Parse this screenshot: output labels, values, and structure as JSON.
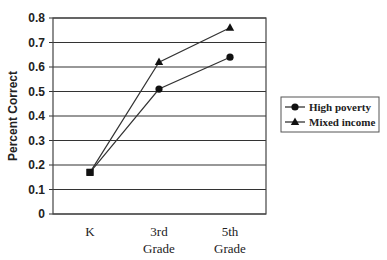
{
  "chart_data": {
    "type": "line",
    "title": "",
    "xlabel": "",
    "ylabel": "Percent Correct",
    "categories": [
      "K",
      "3rd Grade",
      "5th Grade"
    ],
    "category_lines": [
      [
        "K"
      ],
      [
        "3rd",
        "Grade"
      ],
      [
        "5th",
        "Grade"
      ]
    ],
    "series": [
      {
        "name": "High poverty",
        "marker": "circle",
        "values": [
          0.17,
          0.51,
          0.64
        ]
      },
      {
        "name": "Mixed income",
        "marker": "triangle",
        "values": [
          0.17,
          0.62,
          0.76
        ]
      }
    ],
    "ylim": [
      0,
      0.8
    ],
    "yticks": [
      "0",
      "0.1",
      "0.2",
      "0.3",
      "0.4",
      "0.5",
      "0.6",
      "0.7",
      "0.8"
    ],
    "grid": {
      "horizontal": true,
      "vertical": false
    },
    "legend": {
      "position": "right",
      "entries": [
        "High poverty",
        "Mixed income"
      ]
    },
    "colors": {
      "line": "#333333",
      "grid": "#333333",
      "text": "#222222"
    }
  }
}
